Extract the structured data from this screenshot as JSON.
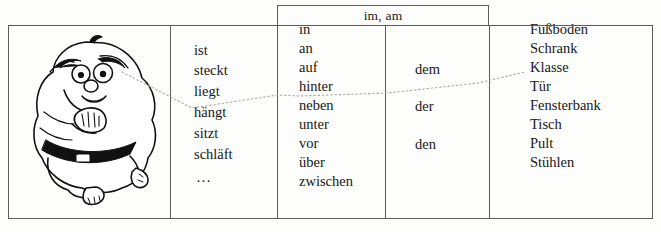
{
  "exercise": {
    "header": {
      "label": "im, am"
    },
    "columns": [
      {
        "name": "figure",
        "illustration": "cartoon-fat-man",
        "items": []
      },
      {
        "name": "verbs",
        "items": [
          "ist",
          "steckt",
          "liegt",
          "hängt",
          "sitzt",
          "schläft",
          "…"
        ]
      },
      {
        "name": "prepositions",
        "items": [
          "in",
          "an",
          "auf",
          "hinter",
          "neben",
          "unter",
          "vor",
          "über",
          "zwischen"
        ]
      },
      {
        "name": "articles",
        "items": [
          "dem",
          "der",
          "den"
        ]
      },
      {
        "name": "nouns",
        "items": [
          "Fußboden",
          "Schrank",
          "Klasse",
          "Tür",
          "Fensterbank",
          "Tisch",
          "Pult",
          "Stühlen"
        ]
      }
    ],
    "selected_path": [
      "liegt",
      "auf",
      "dem",
      "Schrank"
    ],
    "colors": {
      "border": "#5b5b5b",
      "text": "#171717",
      "connector": "#b0a9a4",
      "background": "#fdfdfb",
      "ink": "#111111"
    }
  }
}
